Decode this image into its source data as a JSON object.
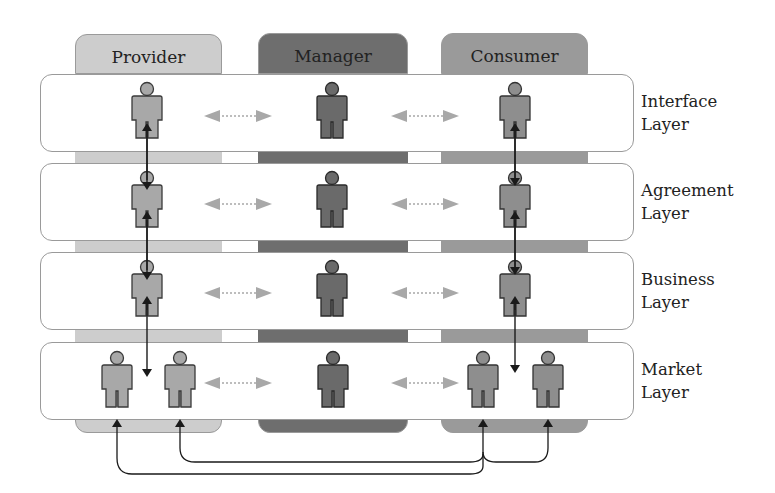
{
  "columns": [
    {
      "label": "Provider",
      "color": "#cdcdcd",
      "x": 75,
      "w": 147
    },
    {
      "label": "Manager",
      "color": "#6e6e6e",
      "x": 258,
      "w": 150
    },
    {
      "label": "Consumer",
      "color": "#9a9a9a",
      "x": 441,
      "w": 147
    }
  ],
  "layers": [
    {
      "label_line1": "Interface",
      "label_line2": "Layer",
      "y": 74
    },
    {
      "label_line1": "Agreement",
      "label_line2": "Layer",
      "y": 163
    },
    {
      "label_line1": "Business",
      "label_line2": "Layer",
      "y": 252
    },
    {
      "label_line1": "Market",
      "label_line2": "Layer",
      "y": 342
    }
  ],
  "figure_colors": {
    "provider": "#a8a8a8",
    "manager": "#6a6a6a",
    "consumer": "#8e8e8e",
    "outline": "#3a3a3a"
  },
  "connector_color": "#a0a0a0",
  "flow_arrow_color": "#1a1a1a"
}
